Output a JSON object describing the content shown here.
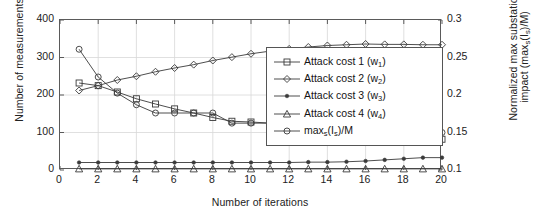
{
  "chart_data": {
    "type": "line",
    "title": "",
    "xlabel": "Number of iterations",
    "ylabel": "Number of measurements",
    "ylabel_right": "Normalized max substation impact (max_s(I_s)/M)",
    "ylabel_right_line1": "Normalized max substation",
    "ylabel_right_line2": "impact (max",
    "x": [
      1,
      2,
      3,
      4,
      5,
      6,
      7,
      8,
      9,
      10,
      11,
      12,
      13,
      14,
      15,
      16,
      17,
      18,
      19,
      20
    ],
    "xlim": [
      0,
      20
    ],
    "ylim": [
      0,
      400
    ],
    "ylim_right": [
      0.1,
      0.3
    ],
    "xticks": [
      0,
      2,
      4,
      6,
      8,
      10,
      12,
      14,
      16,
      18,
      20
    ],
    "yticks_left": [
      0,
      100,
      200,
      300,
      400
    ],
    "yticks_right": [
      "0.1",
      "0.15",
      "0.2",
      "0.25",
      "0.3"
    ],
    "grid": true,
    "legend_position": "center-right",
    "series": [
      {
        "name": "Attack cost 1 (w1)",
        "marker": "square",
        "axis": "left",
        "values": [
          232,
          225,
          208,
          190,
          176,
          163,
          152,
          140,
          130,
          128,
          125,
          122,
          113,
          105,
          96,
          85,
          82,
          82,
          82,
          82
        ]
      },
      {
        "name": "Attack cost 2 (w2)",
        "marker": "diamond",
        "axis": "left",
        "values": [
          212,
          225,
          240,
          250,
          262,
          272,
          281,
          292,
          301,
          310,
          317,
          323,
          328,
          332,
          334,
          336,
          335,
          335,
          334,
          334
        ]
      },
      {
        "name": "Attack cost 3 (w3)",
        "marker": "dot-filled",
        "axis": "left",
        "values": [
          20,
          20,
          20,
          20,
          20,
          20,
          20,
          20,
          20,
          20,
          20,
          20,
          21,
          21,
          22,
          24,
          27,
          30,
          33,
          33
        ]
      },
      {
        "name": "Attack cost 4 (w4)",
        "marker": "triangle",
        "axis": "left",
        "values": [
          3,
          3,
          3,
          3,
          3,
          3,
          3,
          3,
          3,
          3,
          3,
          3,
          3,
          3,
          3,
          3,
          3,
          3,
          3,
          3
        ]
      },
      {
        "name": "maxs(Is)/M",
        "marker": "circle",
        "axis": "left_mapped",
        "values": [
          322,
          248,
          205,
          174,
          152,
          152,
          152,
          152,
          125,
          125,
          125,
          125,
          125,
          125,
          125,
          100,
          100,
          100,
          100,
          100
        ]
      }
    ]
  },
  "legend": {
    "items": [
      {
        "label_pre": "Attack cost 1 (w",
        "sub": "1",
        "label_post": ")",
        "marker": "square"
      },
      {
        "label_pre": "Attack cost 2 (w",
        "sub": "2",
        "label_post": ")",
        "marker": "diamond"
      },
      {
        "label_pre": "Attack cost 3 (w",
        "sub": "3",
        "label_post": ")",
        "marker": "dot-filled"
      },
      {
        "label_pre": "Attack cost 4 (w",
        "sub": "4",
        "label_post": ")",
        "marker": "triangle"
      },
      {
        "label_pre": "max",
        "sub": "s",
        "label_post": "(I",
        "sub2": "s",
        "label_post2": ")/M",
        "marker": "circle"
      }
    ]
  },
  "axes": {
    "left_title": "Number of measurements",
    "right_title_a": "Normalized max substation",
    "right_title_b_pre": "impact (max",
    "right_title_b_sub": "s",
    "right_title_b_mid": "(I",
    "right_title_b_sub2": "s",
    "right_title_b_post": ")/M)",
    "x_title": "Number of iterations",
    "ticks_left": [
      "400",
      "300",
      "200",
      "100",
      "0"
    ],
    "ticks_right": [
      "0.3",
      "0.25",
      "0.2",
      "0.15",
      "0.1"
    ],
    "ticks_x": [
      "0",
      "2",
      "4",
      "6",
      "8",
      "10",
      "12",
      "14",
      "16",
      "18",
      "20"
    ]
  },
  "colors": {
    "line": "#3a3a3a",
    "axis": "#5a5a5a",
    "grid": "#d8d8d8",
    "text": "#1a1a1a",
    "background": "#ffffff"
  }
}
